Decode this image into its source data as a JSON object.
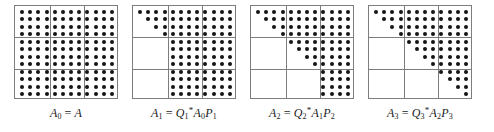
{
  "figure": {
    "grid": {
      "dots_per_side": 12,
      "blocks_per_side": 3,
      "dots_per_block_side": 4
    },
    "dot_color": "#141414",
    "line_color": "#7d7d7d"
  },
  "panels": [
    {
      "id": "panel-0",
      "caption": {
        "lhs_var": "A",
        "lhs_sub": "0",
        "equals": "=",
        "rhs": [
          {
            "var": "A",
            "sub": "",
            "sup": ""
          }
        ],
        "plain": "A0 = A"
      },
      "blocks": [
        [
          "full",
          "full",
          "full"
        ],
        [
          "full",
          "full",
          "full"
        ],
        [
          "full",
          "full",
          "full"
        ]
      ]
    },
    {
      "id": "panel-1",
      "caption": {
        "lhs_var": "A",
        "lhs_sub": "1",
        "equals": "=",
        "rhs": [
          {
            "var": "Q",
            "sub": "1",
            "sup": "*"
          },
          {
            "var": "A",
            "sub": "0",
            "sup": ""
          },
          {
            "var": "P",
            "sub": "1",
            "sup": ""
          }
        ],
        "plain": "A1 = Q1*A0P1"
      },
      "blocks": [
        [
          "triangular",
          "full",
          "full"
        ],
        [
          "empty",
          "full",
          "full"
        ],
        [
          "empty",
          "full",
          "full"
        ]
      ]
    },
    {
      "id": "panel-2",
      "caption": {
        "lhs_var": "A",
        "lhs_sub": "2",
        "equals": "=",
        "rhs": [
          {
            "var": "Q",
            "sub": "2",
            "sup": "*"
          },
          {
            "var": "A",
            "sub": "1",
            "sup": ""
          },
          {
            "var": "P",
            "sub": "2",
            "sup": ""
          }
        ],
        "plain": "A2 = Q2*A1P2"
      },
      "blocks": [
        [
          "triangular",
          "full",
          "full"
        ],
        [
          "empty",
          "triangular",
          "full"
        ],
        [
          "empty",
          "empty",
          "full"
        ]
      ]
    },
    {
      "id": "panel-3",
      "caption": {
        "lhs_var": "A",
        "lhs_sub": "3",
        "equals": "=",
        "rhs": [
          {
            "var": "Q",
            "sub": "3",
            "sup": "*"
          },
          {
            "var": "A",
            "sub": "2",
            "sup": ""
          },
          {
            "var": "P",
            "sub": "3",
            "sup": ""
          }
        ],
        "plain": "A3 = Q3*A2P3"
      },
      "blocks": [
        [
          "triangular",
          "full",
          "full"
        ],
        [
          "empty",
          "triangular",
          "full"
        ],
        [
          "empty",
          "empty",
          "triangular"
        ]
      ]
    }
  ]
}
